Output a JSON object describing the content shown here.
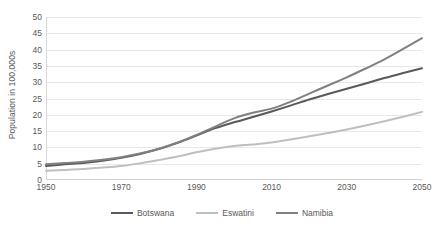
{
  "chart_data": {
    "type": "line",
    "title": "",
    "subtitle": "",
    "xlabel": "",
    "ylabel": "Population in 100,000s",
    "xlim": [
      1950,
      2050
    ],
    "ylim": [
      0,
      50
    ],
    "ytick_step": 5,
    "xtick_step": 20,
    "grid": true,
    "legend_position": "bottom",
    "y_ticks": [
      "0",
      "5",
      "10",
      "15",
      "20",
      "25",
      "30",
      "35",
      "40",
      "45",
      "50"
    ],
    "x_ticks": [
      "1950",
      "1970",
      "1990",
      "2010",
      "2030",
      "2050"
    ],
    "x": [
      1950,
      1955,
      1960,
      1965,
      1970,
      1975,
      1980,
      1985,
      1990,
      1995,
      2000,
      2005,
      2010,
      2015,
      2020,
      2025,
      2030,
      2035,
      2040,
      2045,
      2050
    ],
    "series": [
      {
        "name": "Botswana",
        "color": "#595959",
        "values": [
          4.3,
          4.8,
          5.2,
          5.9,
          6.8,
          8.0,
          9.5,
          11.4,
          13.6,
          15.9,
          17.7,
          19.3,
          21.0,
          22.8,
          24.7,
          26.4,
          28.0,
          29.6,
          31.3,
          32.8,
          34.3
        ]
      },
      {
        "name": "Eswatini",
        "color": "#bfbfbf",
        "values": [
          2.8,
          3.1,
          3.4,
          3.8,
          4.3,
          5.1,
          6.1,
          7.2,
          8.5,
          9.6,
          10.4,
          10.9,
          11.5,
          12.4,
          13.4,
          14.4,
          15.5,
          16.7,
          18.0,
          19.4,
          20.9
        ]
      },
      {
        "name": "Namibia",
        "color": "#808080",
        "values": [
          4.8,
          5.2,
          5.6,
          6.2,
          7.0,
          8.1,
          9.6,
          11.5,
          13.8,
          16.4,
          18.9,
          20.6,
          21.9,
          24.0,
          26.5,
          29.0,
          31.5,
          34.2,
          37.0,
          40.2,
          43.5
        ]
      }
    ]
  },
  "legend": {
    "items": [
      {
        "label": "Botswana"
      },
      {
        "label": "Eswatini"
      },
      {
        "label": "Namibia"
      }
    ]
  }
}
